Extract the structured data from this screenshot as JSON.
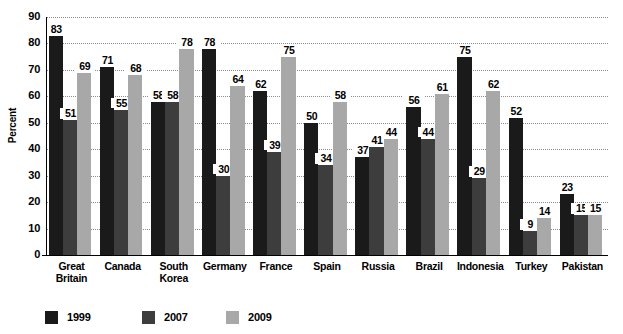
{
  "chart_data": {
    "type": "bar",
    "title": "",
    "xlabel": "",
    "ylabel": "Percent",
    "ylim": [
      0,
      90
    ],
    "yticks": [
      0,
      10,
      20,
      30,
      40,
      50,
      60,
      70,
      80,
      90
    ],
    "grid": true,
    "legend_position": "bottom-left",
    "categories": [
      "Great Britain",
      "Canada",
      "South Korea",
      "Germany",
      "France",
      "Spain",
      "Russia",
      "Brazil",
      "Indonesia",
      "Turkey",
      "Pakistan"
    ],
    "category_lines": [
      [
        "Great",
        "Britain"
      ],
      [
        "Canada"
      ],
      [
        "South",
        "Korea"
      ],
      [
        "Germany"
      ],
      [
        "France"
      ],
      [
        "Spain"
      ],
      [
        "Russia"
      ],
      [
        "Brazil"
      ],
      [
        "Indonesia"
      ],
      [
        "Turkey"
      ],
      [
        "Pakistan"
      ]
    ],
    "series": [
      {
        "name": "1999",
        "color": "#1a1a1a",
        "values": [
          83,
          71,
          58,
          78,
          62,
          50,
          37,
          56,
          75,
          52,
          23
        ]
      },
      {
        "name": "2007",
        "color": "#3d3d3d",
        "values": [
          51,
          55,
          58,
          30,
          39,
          34,
          41,
          44,
          29,
          9,
          15
        ]
      },
      {
        "name": "2009",
        "color": "#a8a8a8",
        "values": [
          69,
          68,
          78,
          64,
          75,
          58,
          44,
          61,
          62,
          14,
          15
        ]
      }
    ]
  },
  "legend": {
    "items": [
      {
        "label": "1999",
        "color": "#1a1a1a"
      },
      {
        "label": "2007",
        "color": "#3d3d3d"
      },
      {
        "label": "2009",
        "color": "#a8a8a8"
      }
    ]
  },
  "axis": {
    "y_title": "Percent",
    "y_tick_labels": [
      "90",
      "80",
      "70",
      "60",
      "50",
      "40",
      "30",
      "20",
      "10",
      "0"
    ]
  }
}
